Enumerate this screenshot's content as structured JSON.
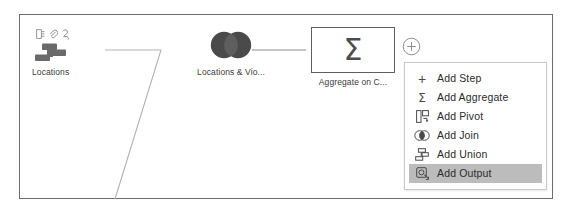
{
  "canvas": {
    "name": "flow-canvas"
  },
  "nodes": [
    {
      "id": "locations",
      "label": "Locations",
      "icon": "input-step-icon",
      "badges": [
        "document-icon",
        "paperclip-icon",
        "clean-step-icon"
      ]
    },
    {
      "id": "join",
      "label": "Locations & Vio...",
      "icon": "join-icon"
    },
    {
      "id": "aggregate",
      "label": "Aggregate on C...",
      "icon": "sigma-icon",
      "symbol": "Σ"
    }
  ],
  "add_button": {
    "name": "add-step-plus-button",
    "icon": "plus-circle-icon"
  },
  "menu": {
    "name": "add-step-menu",
    "items": [
      {
        "label": "Add Step",
        "icon": "plus-icon",
        "icon_glyph": "+",
        "selected": false
      },
      {
        "label": "Add Aggregate",
        "icon": "sigma-icon",
        "icon_glyph": "Σ",
        "selected": false
      },
      {
        "label": "Add Pivot",
        "icon": "pivot-icon",
        "icon_glyph": "",
        "selected": false
      },
      {
        "label": "Add Join",
        "icon": "join-icon",
        "icon_glyph": "",
        "selected": false
      },
      {
        "label": "Add Union",
        "icon": "union-icon",
        "icon_glyph": "",
        "selected": false
      },
      {
        "label": "Add Output",
        "icon": "output-icon",
        "icon_glyph": "",
        "selected": true
      }
    ]
  },
  "colors": {
    "canvas_border": "#6d6d6d",
    "node_icon": "#4d4d4d",
    "connector": "#b3b3b3",
    "menu_highlight": "#bcbcbc",
    "menu_border": "#c9c9c9",
    "text": "#2b2b2b"
  }
}
